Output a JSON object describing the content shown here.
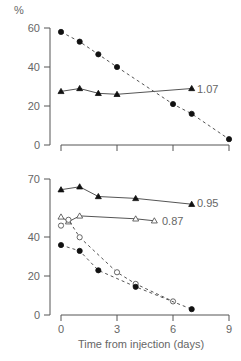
{
  "chart_data": [
    {
      "type": "line",
      "panel": "top",
      "ylabel": "%",
      "ylim": [
        0,
        60
      ],
      "yticks": [
        "0",
        "20",
        "40",
        "60"
      ],
      "xlim": [
        0,
        9
      ],
      "xticks": [
        0,
        3,
        6,
        9
      ],
      "series": [
        {
          "name": "filled circles (dashed)",
          "marker": "filled-circle",
          "x": [
            0,
            1,
            2,
            3,
            6,
            7,
            9
          ],
          "values": [
            58,
            53,
            46.5,
            40,
            21,
            16,
            3
          ]
        },
        {
          "name": "filled triangles (solid)",
          "marker": "filled-triangle",
          "x": [
            0,
            1,
            2,
            3,
            7
          ],
          "values": [
            27.5,
            29,
            26.5,
            26,
            29
          ],
          "annotation": "1.07"
        }
      ]
    },
    {
      "type": "line",
      "panel": "bottom",
      "ylim": [
        0,
        70
      ],
      "yticks": [
        "0",
        "20",
        "40",
        "70"
      ],
      "xlim": [
        0,
        9
      ],
      "xticks": [
        "0",
        "3",
        "6",
        "9"
      ],
      "xlabel": "Time from injection (days)",
      "series": [
        {
          "name": "filled triangles (solid)",
          "marker": "filled-triangle",
          "x": [
            0,
            1,
            2,
            4,
            7
          ],
          "values": [
            64.5,
            66,
            61,
            60,
            57
          ],
          "annotation": "0.95"
        },
        {
          "name": "open triangles (solid)",
          "marker": "open-triangle",
          "x": [
            0,
            0.4,
            1,
            4,
            5
          ],
          "values": [
            50.5,
            48,
            51,
            49.5,
            48.5
          ],
          "annotation": "0.87"
        },
        {
          "name": "open circles (dashed)",
          "marker": "open-circle",
          "x": [
            0,
            0.4,
            1,
            3,
            4,
            6
          ],
          "values": [
            46,
            49,
            40,
            22,
            16,
            7
          ]
        },
        {
          "name": "filled circles (dashed)",
          "marker": "filled-circle",
          "x": [
            0,
            1,
            2,
            4,
            7
          ],
          "values": [
            36,
            33,
            23,
            14.5,
            3
          ]
        }
      ]
    }
  ],
  "labels": {
    "y_unit": "%",
    "top_annotation": "1.07",
    "bottom_annotation_1": "0.95",
    "bottom_annotation_2": "0.87",
    "xlabel": "Time from injection (days)",
    "top_yticks": [
      "60",
      "40",
      "20",
      "0"
    ],
    "bottom_yticks": [
      "70",
      "40",
      "20",
      "0"
    ],
    "xticks": [
      "0",
      "3",
      "6",
      "9"
    ]
  }
}
